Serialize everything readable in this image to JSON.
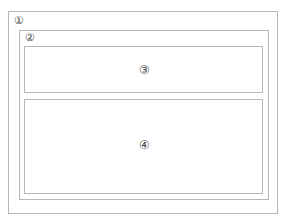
{
  "diagram": {
    "regions": [
      {
        "id": 1,
        "label": "①"
      },
      {
        "id": 2,
        "label": "②"
      },
      {
        "id": 3,
        "label": "③"
      },
      {
        "id": 4,
        "label": "④"
      }
    ]
  }
}
